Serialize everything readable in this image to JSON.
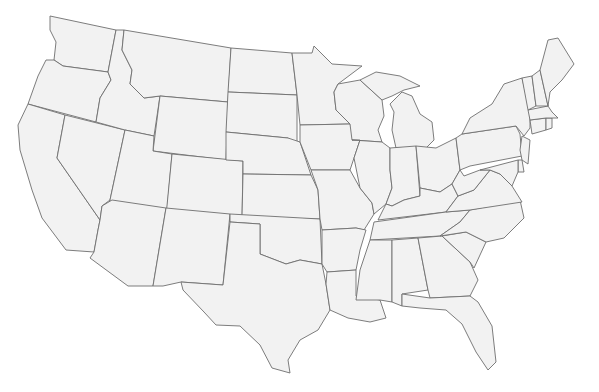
{
  "map": {
    "type": "outline",
    "region": "Contiguous United States",
    "fill_color": "#f2f2f2",
    "stroke_color": "#6e6e6e",
    "background_color": "#ffffff",
    "labels_visible": false,
    "states": [
      {
        "id": "WA",
        "name": "Washington",
        "points": "50,16 116,30 108,72 63,66 54,60 56,42 50,30"
      },
      {
        "id": "OR",
        "name": "Oregon",
        "points": "54,60 63,66 108,72 111,80 100,98 96,122 28,104 38,76 46,60"
      },
      {
        "id": "CA",
        "name": "California",
        "points": "28,104 65,115 57,158 100,220 98,230 94,252 66,250 42,218 32,190 20,150 18,125"
      },
      {
        "id": "NV",
        "name": "Nevada",
        "points": "65,115 125,130 110,200 102,206 100,220 57,158"
      },
      {
        "id": "ID",
        "name": "Idaho",
        "points": "116,30 124,30 122,50 132,70 130,84 144,98 160,96 154,136 125,130 96,122 100,98 111,80 108,72"
      },
      {
        "id": "MT",
        "name": "Montana",
        "points": "124,30 231,48 228,102 160,96 144,98 130,84 132,70 122,50"
      },
      {
        "id": "WY",
        "name": "Wyoming",
        "points": "160,96 228,102 226,160 153,151"
      },
      {
        "id": "UT",
        "name": "Utah",
        "points": "125,130 154,136 153,151 172,154 166,222 112,214 110,200"
      },
      {
        "id": "CO",
        "name": "Colorado",
        "points": "172,154 243,161 242,222 166,216"
      },
      {
        "id": "AZ",
        "name": "Arizona",
        "points": "112,200 166,208 153,286 128,286 90,258 94,252 98,230 100,220 102,206"
      },
      {
        "id": "NM",
        "name": "New Mexico",
        "points": "166,208 230,214 223,285 181,282 163,286 153,286"
      },
      {
        "id": "ND",
        "name": "North Dakota",
        "points": "231,48 292,53 297,95 228,92"
      },
      {
        "id": "SD",
        "name": "South Dakota",
        "points": "228,92 297,95 297,146 288,138 226,132"
      },
      {
        "id": "NE",
        "name": "Nebraska",
        "points": "226,132 288,138 300,142 311,175 243,174 243,161 226,160"
      },
      {
        "id": "KS",
        "name": "Kansas",
        "points": "243,174 311,175 318,190 320,219 242,217"
      },
      {
        "id": "OK",
        "name": "Oklahoma",
        "points": "230,214 320,219 322,264 300,260 286,264 260,254 260,224 230,222"
      },
      {
        "id": "TX",
        "name": "Texas",
        "points": "230,222 260,224 260,254 286,264 300,260 322,264 326,284 330,310 318,330 300,340 288,360 290,373 272,368 260,345 240,326 216,325 204,312 183,290 181,282 223,285"
      },
      {
        "id": "MN",
        "name": "Minnesota",
        "points": "292,53 312,53 314,46 332,64 362,66 338,84 334,92 336,110 350,124 300,125 297,95"
      },
      {
        "id": "IA",
        "name": "Iowa",
        "points": "300,125 350,124 360,140 354,158 350,170 311,170 300,142"
      },
      {
        "id": "MO",
        "name": "Missouri",
        "points": "311,170 350,170 360,188 372,203 374,214 364,230 356,228 322,230 320,219 318,190"
      },
      {
        "id": "AR",
        "name": "Arkansas",
        "points": "322,230 356,228 366,230 360,250 356,270 327,272 322,264"
      },
      {
        "id": "LA",
        "name": "Louisiana",
        "points": "327,272 356,270 356,296 380,300 386,318 370,322 348,318 330,310 326,284"
      },
      {
        "id": "WI",
        "name": "Wisconsin",
        "points": "338,84 360,80 382,100 384,116 378,130 382,142 352,140 350,124 336,110 334,92"
      },
      {
        "id": "IL",
        "name": "Illinois",
        "points": "352,140 382,142 390,148 390,170 392,188 386,204 374,214 372,203 360,188 354,158 360,140"
      },
      {
        "id": "MI",
        "name": "Michigan",
        "points": "390,104 402,92 412,96 420,114 432,122 434,140 426,148 396,148 392,130 394,112"
      },
      {
        "id": "MI_UP",
        "name": "Michigan Upper Peninsula",
        "points": "360,80 376,72 400,76 420,86 404,90 392,96 382,100"
      },
      {
        "id": "IN",
        "name": "Indiana",
        "points": "390,148 416,146 420,196 404,200 392,206 386,204 392,188 390,170"
      },
      {
        "id": "OH",
        "name": "Ohio",
        "points": "416,146 436,148 456,138 460,170 452,184 440,192 420,188"
      },
      {
        "id": "KY",
        "name": "Kentucky",
        "points": "386,204 392,206 404,200 420,196 420,188 440,192 452,184 458,196 446,212 378,220"
      },
      {
        "id": "TN",
        "name": "Tennessee",
        "points": "374,222 446,212 470,210 460,222 440,236 370,240"
      },
      {
        "id": "MS",
        "name": "Mississippi",
        "points": "370,240 392,240 392,302 380,300 356,300 360,270 366,252"
      },
      {
        "id": "AL",
        "name": "Alabama",
        "points": "392,240 418,238 428,290 402,294 402,306 392,302"
      },
      {
        "id": "GA",
        "name": "Georgia",
        "points": "418,238 442,236 470,262 478,280 470,296 430,298 428,290"
      },
      {
        "id": "FL",
        "name": "Florida",
        "points": "402,294 430,298 470,296 478,302 492,326 496,362 488,370 476,352 462,324 446,310 420,308 402,306"
      },
      {
        "id": "SC",
        "name": "South Carolina",
        "points": "442,236 466,232 486,242 474,268 470,262"
      },
      {
        "id": "NC",
        "name": "North Carolina",
        "points": "440,236 460,222 470,210 520,200 524,218 504,238 486,242 466,232"
      },
      {
        "id": "VA",
        "name": "Virginia",
        "points": "446,212 458,196 474,190 490,170 500,174 512,186 522,202 470,210"
      },
      {
        "id": "WV",
        "name": "West Virginia",
        "points": "452,184 460,170 464,176 480,170 490,170 474,190 458,196"
      },
      {
        "id": "PA",
        "name": "Pennsylvania",
        "points": "456,138 462,134 516,126 520,134 522,156 470,166 460,170"
      },
      {
        "id": "NY",
        "name": "New York",
        "points": "462,134 470,118 492,104 504,84 522,78 530,112 530,128 524,136 516,126"
      },
      {
        "id": "NJ",
        "name": "New Jersey",
        "points": "522,136 530,140 528,164 522,160 520,150"
      },
      {
        "id": "DE",
        "name": "Delaware",
        "points": "518,160 522,160 524,172 518,172"
      },
      {
        "id": "MD",
        "name": "Maryland",
        "points": "480,170 518,160 518,172 512,186 500,174 490,170"
      },
      {
        "id": "CT",
        "name": "Connecticut",
        "points": "530,120 546,118 546,130 532,134"
      },
      {
        "id": "RI",
        "name": "Rhode Island",
        "points": "546,118 552,118 552,128 546,130"
      },
      {
        "id": "MA",
        "name": "Massachusetts",
        "points": "528,110 548,106 552,112 558,118 552,118 546,118 530,120"
      },
      {
        "id": "VT",
        "name": "Vermont",
        "points": "522,78 532,76 536,106 528,110"
      },
      {
        "id": "NH",
        "name": "New Hampshire",
        "points": "532,76 540,70 548,106 536,106"
      },
      {
        "id": "ME",
        "name": "Maine",
        "points": "540,70 548,40 558,38 574,64 562,80 550,92 548,106"
      }
    ]
  }
}
